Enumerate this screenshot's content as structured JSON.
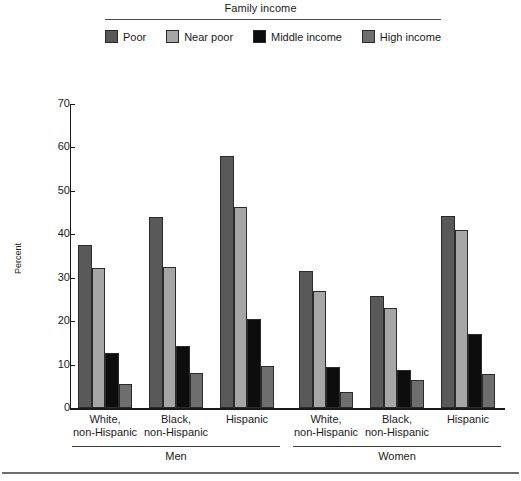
{
  "legend": {
    "title": "Family income",
    "items": [
      {
        "label": "Poor",
        "color": "#595959",
        "swatch_name": "legend-swatch-poor"
      },
      {
        "label": "Near poor",
        "color": "#a6a6a6",
        "swatch_name": "legend-swatch-near-poor"
      },
      {
        "label": "Middle income",
        "color": "#0d0d0d",
        "swatch_name": "legend-swatch-middle-income"
      },
      {
        "label": "High income",
        "color": "#6e6e6e",
        "swatch_name": "legend-swatch-high-income"
      }
    ]
  },
  "axis": {
    "ylabel": "Percent",
    "yticks": [
      "0",
      "10",
      "20",
      "30",
      "40",
      "50",
      "60",
      "70"
    ]
  },
  "groups": [
    {
      "line1": "White,",
      "line2": "non-Hispanic",
      "sex": "Men"
    },
    {
      "line1": "Black,",
      "line2": "non-Hispanic",
      "sex": "Men"
    },
    {
      "line1": "Hispanic",
      "line2": "",
      "sex": "Men"
    },
    {
      "line1": "White,",
      "line2": "non-Hispanic",
      "sex": "Women"
    },
    {
      "line1": "Black,",
      "line2": "non-Hispanic",
      "sex": "Women"
    },
    {
      "line1": "Hispanic",
      "line2": "",
      "sex": "Women"
    }
  ],
  "sex_sections": [
    {
      "label": "Men"
    },
    {
      "label": "Women"
    }
  ],
  "chart_data": {
    "type": "bar",
    "title": "Family income",
    "xlabel": "",
    "ylabel": "Percent",
    "ylim": [
      0,
      70
    ],
    "ytick_step": 10,
    "grid": false,
    "legend_position": "top",
    "categories": [
      "Men — White, non-Hispanic",
      "Men — Black, non-Hispanic",
      "Men — Hispanic",
      "Women — White, non-Hispanic",
      "Women — Black, non-Hispanic",
      "Women — Hispanic"
    ],
    "series": [
      {
        "name": "Poor",
        "color": "#595959",
        "values": [
          37.6,
          44.0,
          58.0,
          31.5,
          25.7,
          44.3
        ]
      },
      {
        "name": "Near poor",
        "color": "#a6a6a6",
        "values": [
          32.3,
          32.5,
          46.2,
          27.0,
          23.0,
          41.0
        ]
      },
      {
        "name": "Middle income",
        "color": "#0d0d0d",
        "values": [
          12.7,
          14.3,
          20.6,
          9.4,
          8.8,
          17.1
        ]
      },
      {
        "name": "High income",
        "color": "#6e6e6e",
        "values": [
          5.6,
          8.0,
          9.6,
          3.7,
          6.5,
          7.9
        ]
      }
    ]
  }
}
